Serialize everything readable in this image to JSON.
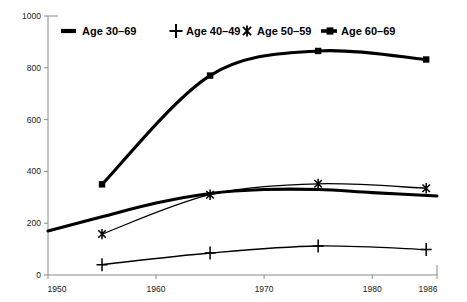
{
  "chart_data": {
    "type": "line",
    "title": "",
    "subtitle": "",
    "xlabel": "",
    "ylabel": "",
    "xlim": [
      1950,
      1986
    ],
    "ylim": [
      0,
      1000
    ],
    "grid": false,
    "legend_position": "top-center",
    "x_ticks": [
      "1950",
      "1960",
      "1970",
      "1980",
      "1986"
    ],
    "x_tick_values": [
      1950,
      1960,
      1970,
      1980,
      1986
    ],
    "y_ticks": [
      "0",
      "200",
      "400",
      "600",
      "800",
      "1000"
    ],
    "y_tick_values": [
      0,
      200,
      400,
      600,
      800,
      1000
    ],
    "x": [
      1955,
      1965,
      1975,
      1985
    ],
    "series": [
      {
        "name": "Age 30–69",
        "marker": "none",
        "line": "thick",
        "x": [
          1950,
          1955,
          1960,
          1965,
          1970,
          1975,
          1980,
          1986
        ],
        "values": [
          170,
          225,
          278,
          315,
          330,
          330,
          318,
          305
        ]
      },
      {
        "name": "Age 40–49",
        "marker": "plus",
        "line": "thin",
        "x": [
          1955,
          1965,
          1975,
          1985
        ],
        "values": [
          40,
          85,
          112,
          98
        ]
      },
      {
        "name": "Age 50–59",
        "marker": "asterisk",
        "line": "thin",
        "x": [
          1955,
          1965,
          1975,
          1985
        ],
        "values": [
          158,
          310,
          352,
          335
        ]
      },
      {
        "name": "Age 60–69",
        "marker": "square",
        "line": "thick",
        "x": [
          1955,
          1965,
          1975,
          1985
        ],
        "values": [
          350,
          770,
          865,
          832
        ]
      }
    ]
  },
  "legend": {
    "items": [
      {
        "label": "Age 30–69",
        "marker": "line-thick",
        "color": "#000000"
      },
      {
        "label": "Age 40–49",
        "marker": "plus",
        "color": "#000000"
      },
      {
        "label": "Age 50–59",
        "marker": "asterisk",
        "color": "#000000"
      },
      {
        "label": "Age 60–69",
        "marker": "line-square",
        "color": "#000000"
      }
    ]
  },
  "colors": {
    "series": "#000000",
    "axis": "#8a8a8a",
    "background": "#ffffff",
    "text": "#1a1a1a"
  }
}
